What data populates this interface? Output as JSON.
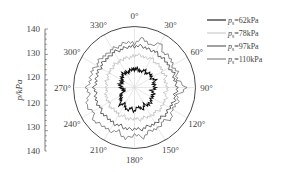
{
  "chart_data": {
    "type": "polar-line",
    "title": "",
    "radial_axis": {
      "label": "p/kPa",
      "ticks_upper": [
        "140",
        "130",
        "120"
      ],
      "ticks_lower": [
        "120",
        "130",
        "140"
      ],
      "tick_values": [
        140,
        130,
        120,
        120,
        130,
        140
      ],
      "range": [
        115,
        140
      ]
    },
    "angular_axis": {
      "labels": [
        "0°",
        "30°",
        "60°",
        "90°",
        "120°",
        "150°",
        "180°",
        "210°",
        "240°",
        "270°",
        "300°",
        "330°"
      ],
      "angles": [
        0,
        30,
        60,
        90,
        120,
        150,
        180,
        210,
        240,
        270,
        300,
        330
      ],
      "direction": "clockwise",
      "zero": "top"
    },
    "angle_step_deg": 10,
    "series": [
      {
        "name": "p_s=62kPa",
        "label_prefix": "p",
        "label_sub": "s",
        "label_value": "=62kPa",
        "color": "#111111",
        "width": 1.1,
        "values": [
          122.5,
          122.8,
          121.8,
          123.2,
          122.5,
          123.8,
          122.6,
          124.0,
          122.8,
          123.6,
          122.2,
          123.4,
          123.0,
          123.8,
          124.2,
          123.0,
          124.6,
          122.8,
          124.8,
          123.5,
          125.0,
          122.6,
          124.2,
          122.0,
          121.8,
          119.6,
          119.8,
          120.4,
          121.2,
          120.6,
          121.0,
          121.6,
          122.4,
          122.0,
          121.8,
          122.6
        ]
      },
      {
        "name": "p_s=78kPa",
        "label_prefix": "p",
        "label_sub": "s",
        "label_value": "=78kPa",
        "color": "#c8c8c8",
        "width": 1.0,
        "values": [
          128.0,
          128.6,
          127.8,
          128.9,
          128.2,
          128.8,
          127.9,
          128.6,
          127.6,
          128.7,
          127.7,
          128.8,
          128.4,
          128.9,
          128.1,
          128.6,
          127.8,
          128.4,
          127.6,
          128.3,
          127.5,
          128.1,
          127.2,
          127.8,
          127.0,
          127.4,
          126.8,
          126.4,
          126.9,
          126.6,
          127.2,
          127.0,
          127.5,
          127.2,
          127.7,
          127.4
        ]
      },
      {
        "name": "p_s=97kPa",
        "label_prefix": "p",
        "label_sub": "s",
        "label_value": "=97kPa",
        "color": "#555555",
        "width": 0.9,
        "values": [
          131.8,
          132.3,
          131.6,
          132.0,
          131.4,
          131.9,
          131.3,
          132.1,
          131.6,
          132.6,
          131.8,
          132.2,
          131.5,
          131.9,
          131.4,
          132.2,
          131.7,
          132.4,
          131.9,
          132.3,
          131.6,
          132.1,
          131.5,
          132.0,
          131.2,
          131.8,
          131.0,
          131.6,
          130.8,
          131.4,
          131.0,
          131.6,
          131.2,
          131.8,
          131.4,
          131.9
        ]
      },
      {
        "name": "p_s=110kPa",
        "label_prefix": "p",
        "label_sub": "s",
        "label_value": "=110kPa",
        "color": "#7a7a7a",
        "width": 0.9,
        "values": [
          133.0,
          135.6,
          133.2,
          136.0,
          133.4,
          134.2,
          132.8,
          133.6,
          132.6,
          136.2,
          132.8,
          133.8,
          132.6,
          134.8,
          133.0,
          134.4,
          133.6,
          135.8,
          134.2,
          136.4,
          134.0,
          135.6,
          135.2,
          136.6,
          134.6,
          136.2,
          133.8,
          134.6,
          133.2,
          133.8,
          132.8,
          133.4,
          132.6,
          133.2,
          133.0,
          134.0
        ]
      }
    ],
    "legend_position": "upper-right"
  }
}
